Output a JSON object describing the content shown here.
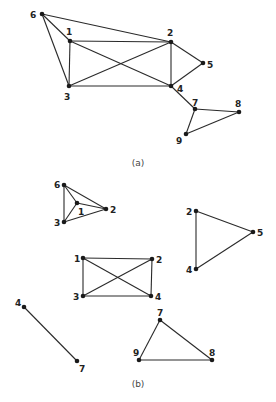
{
  "figure": {
    "width": 276,
    "height": 402,
    "colors": {
      "edge": "#2a2a2a",
      "node": "#1a1a1a",
      "label": "#222222",
      "caption": "#444444",
      "background": "#ffffff"
    }
  },
  "panels": [
    {
      "id": "a",
      "caption": "(a)",
      "caption_pos": [
        138,
        166
      ],
      "nodes": [
        {
          "id": "6",
          "label": "6",
          "x": 42,
          "y": 14,
          "lx": 30,
          "ly": 18
        },
        {
          "id": "1",
          "label": "1",
          "x": 70,
          "y": 41,
          "lx": 66,
          "ly": 35
        },
        {
          "id": "2",
          "label": "2",
          "x": 171,
          "y": 42,
          "lx": 167,
          "ly": 36
        },
        {
          "id": "3",
          "label": "3",
          "x": 69,
          "y": 86,
          "lx": 64,
          "ly": 100
        },
        {
          "id": "4",
          "label": "4",
          "x": 171,
          "y": 86,
          "lx": 177,
          "ly": 92
        },
        {
          "id": "5",
          "label": "5",
          "x": 203,
          "y": 63,
          "lx": 207,
          "ly": 68
        },
        {
          "id": "7",
          "label": "7",
          "x": 195,
          "y": 109,
          "lx": 192,
          "ly": 106
        },
        {
          "id": "8",
          "label": "8",
          "x": 239,
          "y": 112,
          "lx": 235,
          "ly": 107
        },
        {
          "id": "9",
          "label": "9",
          "x": 186,
          "y": 134,
          "lx": 176,
          "ly": 144
        }
      ],
      "edges": [
        [
          "6",
          "1"
        ],
        [
          "6",
          "3"
        ],
        [
          "6",
          "2"
        ],
        [
          "1",
          "2"
        ],
        [
          "1",
          "3"
        ],
        [
          "1",
          "4"
        ],
        [
          "3",
          "2"
        ],
        [
          "3",
          "4"
        ],
        [
          "2",
          "4"
        ],
        [
          "2",
          "5"
        ],
        [
          "4",
          "5"
        ],
        [
          "4",
          "7"
        ],
        [
          "7",
          "8"
        ],
        [
          "7",
          "9"
        ],
        [
          "9",
          "8"
        ]
      ]
    },
    {
      "id": "b",
      "caption": "(b)",
      "caption_pos": [
        138,
        387
      ],
      "nodes": [
        {
          "id": "b6",
          "label": "6",
          "x": 64,
          "y": 185,
          "lx": 54,
          "ly": 188
        },
        {
          "id": "b1",
          "label": "1",
          "x": 77,
          "y": 203,
          "lx": 78,
          "ly": 215
        },
        {
          "id": "b2",
          "label": "2",
          "x": 106,
          "y": 209,
          "lx": 110,
          "ly": 213
        },
        {
          "id": "b3",
          "label": "3",
          "x": 64,
          "y": 222,
          "lx": 54,
          "ly": 226
        },
        {
          "id": "c2",
          "label": "2",
          "x": 196,
          "y": 211,
          "lx": 186,
          "ly": 215
        },
        {
          "id": "c5",
          "label": "5",
          "x": 253,
          "y": 232,
          "lx": 257,
          "ly": 236
        },
        {
          "id": "c4",
          "label": "4",
          "x": 196,
          "y": 269,
          "lx": 186,
          "ly": 273
        },
        {
          "id": "d1",
          "label": "1",
          "x": 83,
          "y": 258,
          "lx": 74,
          "ly": 262
        },
        {
          "id": "d2",
          "label": "2",
          "x": 152,
          "y": 259,
          "lx": 156,
          "ly": 263
        },
        {
          "id": "d3",
          "label": "3",
          "x": 83,
          "y": 296,
          "lx": 73,
          "ly": 300
        },
        {
          "id": "d4",
          "label": "4",
          "x": 151,
          "y": 296,
          "lx": 155,
          "ly": 300
        },
        {
          "id": "e4",
          "label": "4",
          "x": 24,
          "y": 307,
          "lx": 15,
          "ly": 306
        },
        {
          "id": "e7",
          "label": "7",
          "x": 77,
          "y": 361,
          "lx": 79,
          "ly": 372
        },
        {
          "id": "f7",
          "label": "7",
          "x": 160,
          "y": 320,
          "lx": 157,
          "ly": 316
        },
        {
          "id": "f9",
          "label": "9",
          "x": 139,
          "y": 360,
          "lx": 133,
          "ly": 356
        },
        {
          "id": "f8",
          "label": "8",
          "x": 212,
          "y": 360,
          "lx": 209,
          "ly": 356
        }
      ],
      "edges": [
        [
          "b6",
          "b1"
        ],
        [
          "b6",
          "b2"
        ],
        [
          "b6",
          "b3"
        ],
        [
          "b1",
          "b2"
        ],
        [
          "b1",
          "b3"
        ],
        [
          "b3",
          "b2"
        ],
        [
          "c2",
          "c5"
        ],
        [
          "c2",
          "c4"
        ],
        [
          "c4",
          "c5"
        ],
        [
          "d1",
          "d2"
        ],
        [
          "d1",
          "d3"
        ],
        [
          "d1",
          "d4"
        ],
        [
          "d2",
          "d3"
        ],
        [
          "d2",
          "d4"
        ],
        [
          "d3",
          "d4"
        ],
        [
          "e4",
          "e7"
        ],
        [
          "f7",
          "f9"
        ],
        [
          "f7",
          "f8"
        ],
        [
          "f9",
          "f8"
        ]
      ]
    }
  ]
}
